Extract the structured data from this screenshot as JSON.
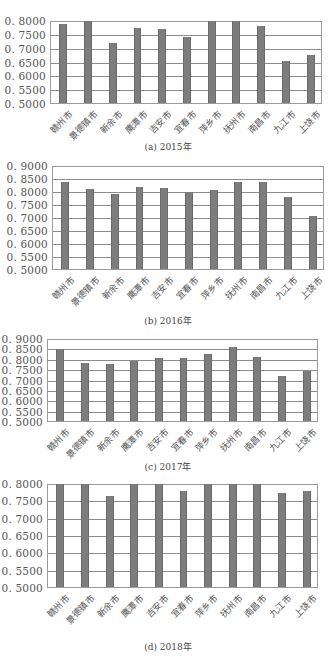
{
  "chart_data": [
    {
      "type": "bar",
      "title": "",
      "caption": "(a) 2015年",
      "xlabel": "",
      "ylabel": "",
      "categories": [
        "赣州市",
        "景德镇市",
        "新余市",
        "鹰潭市",
        "吉安市",
        "宜春市",
        "萍乡市",
        "抚州市",
        "南昌市",
        "九江市",
        "上饶市"
      ],
      "values": [
        0.79,
        0.8,
        0.718,
        0.773,
        0.77,
        0.743,
        0.8,
        0.8,
        0.782,
        0.652,
        0.675
      ],
      "ylim": [
        0.5,
        0.8
      ],
      "yticks": [
        "0.8000",
        "0.7500",
        "0.7000",
        "0.6500",
        "0.6000",
        "0.5500",
        "0.5000"
      ],
      "grid": true,
      "legend": null
    },
    {
      "type": "bar",
      "title": "",
      "caption": "(b) 2016年",
      "xlabel": "",
      "ylabel": "",
      "categories": [
        "赣州市",
        "景德镇市",
        "新余市",
        "鹰潭市",
        "吉安市",
        "宜春市",
        "萍乡市",
        "抚州市",
        "南昌市",
        "九江市",
        "上饶市"
      ],
      "values": [
        0.837,
        0.812,
        0.792,
        0.818,
        0.813,
        0.798,
        0.808,
        0.837,
        0.837,
        0.78,
        0.705
      ],
      "ylim": [
        0.5,
        0.9
      ],
      "yticks": [
        "0.9000",
        "0.8500",
        "0.8000",
        "0.7500",
        "0.7000",
        "0.6500",
        "0.6000",
        "0.5500",
        "0.5000"
      ],
      "grid": true,
      "legend": null
    },
    {
      "type": "bar",
      "title": "",
      "caption": "(c) 2017年",
      "xlabel": "",
      "ylabel": "",
      "categories": [
        "赣州市",
        "景德镇市",
        "新余市",
        "鹰潭市",
        "吉安市",
        "宜春市",
        "萍乡市",
        "抚州市",
        "南昌市",
        "九江市",
        "上饶市"
      ],
      "values": [
        0.852,
        0.785,
        0.778,
        0.792,
        0.805,
        0.808,
        0.827,
        0.86,
        0.81,
        0.72,
        0.745
      ],
      "ylim": [
        0.5,
        0.9
      ],
      "yticks": [
        "0.9000",
        "0.8500",
        "0.8000",
        "0.7500",
        "0.7000",
        "0.6500",
        "0.6000",
        "0.5500",
        "0.5000"
      ],
      "grid": true,
      "legend": null
    },
    {
      "type": "bar",
      "title": "",
      "caption": "(d) 2018年",
      "xlabel": "",
      "ylabel": "",
      "categories": [
        "赣州市",
        "景德镇市",
        "新余市",
        "鹰潭市",
        "吉安市",
        "宜春市",
        "萍乡市",
        "抚州市",
        "南昌市",
        "九江市",
        "上饶市"
      ],
      "values": [
        0.8,
        0.8,
        0.765,
        0.8,
        0.8,
        0.78,
        0.8,
        0.8,
        0.8,
        0.775,
        0.78
      ],
      "ylim": [
        0.5,
        0.8
      ],
      "yticks": [
        "0.8000",
        "0.7500",
        "0.7000",
        "0.6500",
        "0.6000",
        "0.5500",
        "0.5000"
      ],
      "grid": true,
      "legend": null
    }
  ],
  "layout": [
    {
      "top": 21,
      "bottom": 104,
      "left": 50,
      "right": 322,
      "caption_y": 140
    },
    {
      "top": 166,
      "bottom": 270,
      "left": 52,
      "right": 324,
      "caption_y": 314
    },
    {
      "top": 339,
      "bottom": 422,
      "left": 47,
      "right": 318,
      "caption_y": 460
    },
    {
      "top": 484,
      "bottom": 588,
      "left": 47,
      "right": 318,
      "caption_y": 640
    }
  ],
  "colors": {
    "bar": "#7d7d7d",
    "grid": "#8c8c8c",
    "axis_text": "#555555"
  }
}
